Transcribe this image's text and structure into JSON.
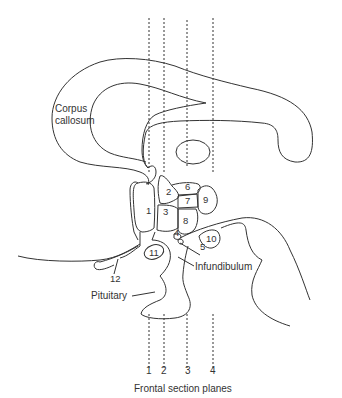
{
  "diagram": {
    "caption": "Frontal section planes",
    "labels": {
      "corpus_line1": "Corpus",
      "corpus_line2": "callosum",
      "infundibulum": "Infundibulum",
      "pituitary": "Pituitary"
    },
    "regions": [
      "1",
      "2",
      "3",
      "4",
      "5",
      "6",
      "7",
      "8",
      "9",
      "10",
      "11",
      "12"
    ],
    "planes": [
      "1",
      "2",
      "3",
      "4"
    ],
    "line_color": "#333333"
  }
}
